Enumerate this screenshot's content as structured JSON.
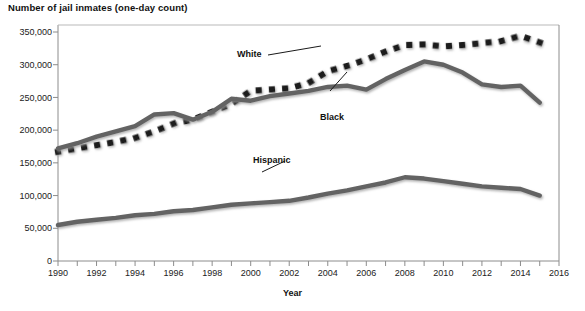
{
  "chart_data": {
    "type": "line",
    "title": "Number of jail inmates (one-day count)",
    "xlabel": "Year",
    "ylabel": "",
    "xlim": [
      1990,
      2016
    ],
    "ylim": [
      0,
      350000
    ],
    "grid": false,
    "legend_position": "inline-annotations",
    "x": [
      1990,
      1991,
      1992,
      1993,
      1994,
      1995,
      1996,
      1997,
      1998,
      1999,
      2000,
      2001,
      2002,
      2003,
      2004,
      2005,
      2006,
      2007,
      2008,
      2009,
      2010,
      2011,
      2012,
      2013,
      2014,
      2015
    ],
    "y_ticks": [
      0,
      50000,
      100000,
      150000,
      200000,
      250000,
      300000,
      350000
    ],
    "y_tick_labels": [
      "0",
      "50,000",
      "100,000",
      "150,000",
      "200,000",
      "250,000",
      "300,000",
      "350,000"
    ],
    "x_ticks": [
      1990,
      1991,
      1992,
      1993,
      1994,
      1995,
      1996,
      1997,
      1998,
      1999,
      2000,
      2001,
      2002,
      2003,
      2004,
      2005,
      2006,
      2007,
      2008,
      2009,
      2010,
      2011,
      2012,
      2013,
      2014,
      2015,
      2016
    ],
    "x_tick_labels": [
      "1990",
      "",
      "1992",
      "",
      "1994",
      "",
      "1996",
      "",
      "1998",
      "",
      "2000",
      "",
      "2002",
      "",
      "2004",
      "",
      "2006",
      "",
      "2008",
      "",
      "2010",
      "",
      "2012",
      "",
      "2014",
      "",
      "2016"
    ],
    "series": [
      {
        "name": "White",
        "style": "dotted-square-markers",
        "color": "#1a1a1a",
        "values": [
          167000,
          172000,
          177000,
          182000,
          188000,
          198000,
          210000,
          216000,
          228000,
          240000,
          260000,
          262000,
          264000,
          272000,
          290000,
          298000,
          308000,
          320000,
          330000,
          331000,
          328000,
          330000,
          333000,
          336000,
          344000,
          334000
        ]
      },
      {
        "name": "Black",
        "style": "solid-thick",
        "color": "#636363",
        "values": [
          172000,
          180000,
          190000,
          198000,
          206000,
          224000,
          226000,
          216000,
          228000,
          248000,
          245000,
          252000,
          256000,
          260000,
          266000,
          268000,
          262000,
          278000,
          292000,
          305000,
          300000,
          288000,
          270000,
          266000,
          268000,
          242000
        ]
      },
      {
        "name": "Hispanic",
        "style": "solid-thick",
        "color": "#636363",
        "values": [
          55000,
          60000,
          63000,
          66000,
          70000,
          72000,
          76000,
          78000,
          82000,
          86000,
          88000,
          90000,
          92000,
          97000,
          103000,
          108000,
          114000,
          120000,
          128000,
          126000,
          122000,
          118000,
          114000,
          112000,
          110000,
          100000
        ]
      }
    ],
    "annotations": [
      {
        "text": "White",
        "for_series": "White"
      },
      {
        "text": "Black",
        "for_series": "Black"
      },
      {
        "text": "Hispanic",
        "for_series": "Hispanic"
      }
    ]
  }
}
